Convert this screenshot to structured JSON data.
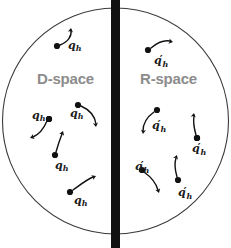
{
  "figure": {
    "type": "schematic-diagram",
    "background_color": "#ffffff",
    "width": 231,
    "height": 248
  },
  "circle": {
    "name": "boundary-circle",
    "cx": 115.5,
    "cy": 121,
    "r": 113,
    "stroke_color": "#3a3a3a",
    "stroke_width": 1.1,
    "fill": "none"
  },
  "divider": {
    "name": "central-barrier",
    "x": 111,
    "y": 0,
    "width": 9,
    "height": 248,
    "color": "#111111"
  },
  "regions": {
    "left": {
      "label": "D-space",
      "label_color": "#8c8c8c",
      "particle_label": "q",
      "particle_subscript": "h",
      "particle_prime": ""
    },
    "right": {
      "label": "R-space",
      "label_color": "#8c8c8c",
      "particle_label": "q",
      "particle_subscript": "h",
      "particle_prime": "′"
    }
  },
  "particle_style": {
    "dot_radius": 3.1,
    "dot_color": "#111111",
    "arrow_color": "#111111",
    "arrow_width": 1.4
  },
  "particles": {
    "d_space": [
      {
        "name": "particle-d-1",
        "dot_x": 57,
        "dot_y": 46,
        "label_x": 68,
        "label_y": 40,
        "path": "M 60 45 C 68 42 72 36 71 30",
        "head_x": 71,
        "head_y": 28,
        "head_angle": -82
      },
      {
        "name": "particle-d-2",
        "dot_x": 49,
        "dot_y": 119,
        "label_x": 32,
        "label_y": 110,
        "path": "M 47 121 C 44 128 40 134 33 137",
        "head_x": 30,
        "head_y": 138,
        "head_angle": 160
      },
      {
        "name": "particle-d-3",
        "dot_x": 78,
        "dot_y": 105,
        "label_x": 70,
        "label_y": 108,
        "path": "M 81 106 C 90 110 95 117 96 124",
        "head_x": 96,
        "head_y": 127,
        "head_angle": 82
      },
      {
        "name": "particle-d-4",
        "dot_x": 55,
        "dot_y": 155,
        "label_x": 55,
        "label_y": 160,
        "path": "M 56 152 C 58 145 60 139 62 134",
        "head_x": 63,
        "head_y": 131,
        "head_angle": -71
      },
      {
        "name": "particle-d-5",
        "dot_x": 70,
        "dot_y": 192,
        "label_x": 74,
        "label_y": 195,
        "path": "M 73 190 C 80 185 86 180 93 177",
        "head_x": 96,
        "head_y": 176,
        "head_angle": -24
      },
      {
        "name": "particle-d-6",
        "dot_x": 49,
        "dot_y": 119,
        "label_x": -999,
        "label_y": -999,
        "path": "",
        "head_x": -999,
        "head_y": -999,
        "head_angle": 0
      }
    ],
    "r_space": [
      {
        "name": "particle-r-1",
        "dot_x": 148,
        "dot_y": 50,
        "label_x": 154,
        "label_y": 54,
        "path": "M 151 48 C 158 42 164 40 170 41",
        "head_x": 173,
        "head_y": 42,
        "head_angle": 12
      },
      {
        "name": "particle-r-2",
        "dot_x": 157,
        "dot_y": 110,
        "label_x": 152,
        "label_y": 119,
        "path": "M 154 112 C 147 117 143 124 143 131",
        "head_x": 143,
        "head_y": 134,
        "head_angle": 96
      },
      {
        "name": "particle-r-3",
        "dot_x": 197,
        "dot_y": 138,
        "label_x": 192,
        "label_y": 142,
        "path": "M 196 135 C 194 128 193 122 194 116",
        "head_x": 194,
        "head_y": 113,
        "head_angle": -79
      },
      {
        "name": "particle-r-4",
        "dot_x": 142,
        "dot_y": 170,
        "label_x": 135,
        "label_y": 160,
        "path": "M 144 172 C 151 177 156 183 158 190",
        "head_x": 159,
        "head_y": 193,
        "head_angle": 72
      },
      {
        "name": "particle-r-5",
        "dot_x": 178,
        "dot_y": 180,
        "label_x": 178,
        "label_y": 186,
        "path": "M 177 177 C 175 170 174 164 176 158",
        "head_x": 177,
        "head_y": 155,
        "head_angle": -68
      },
      {
        "name": "particle-r-6",
        "dot_x": 197,
        "dot_y": 138,
        "label_x": -999,
        "label_y": -999,
        "path": "",
        "head_x": -999,
        "head_y": -999,
        "head_angle": 0
      }
    ]
  }
}
